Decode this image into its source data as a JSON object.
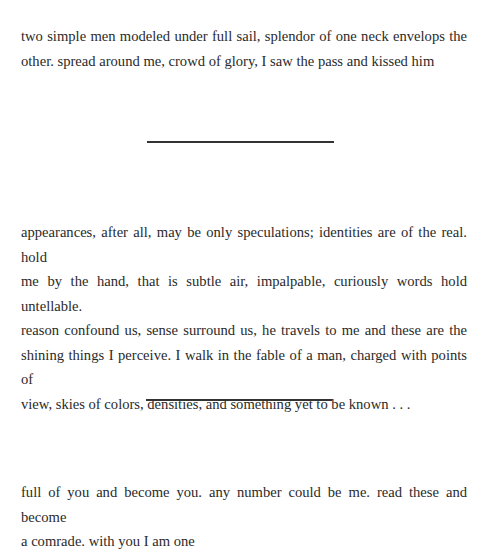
{
  "paragraphs": [
    {
      "lines": [
        "two simple men modeled under full sail, splendor of one neck envelops the",
        "other. spread around me, crowd of glory, I saw the pass and kissed him"
      ]
    },
    {
      "lines": [
        "appearances, after all, may be only speculations; identities are of the real. hold",
        "me by the hand, that is subtle air, impalpable, curiously words hold untellable.",
        "reason confound us, sense surround us, he travels to me and these are the",
        "shining things I perceive. I walk in the fable of a man, charged with points of",
        "view, skies of colors, densities, and something yet to be known . . ."
      ]
    },
    {
      "lines": [
        "full of you and become you. any number could be me. read these and become",
        "a comrade. with you I am one"
      ]
    }
  ],
  "section_dividers": 2
}
